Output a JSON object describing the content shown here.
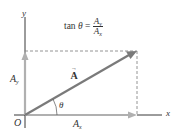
{
  "diagram": {
    "formula": {
      "lhs_func": "tan",
      "lhs_var": "θ",
      "equals": "=",
      "num_main": "A",
      "num_sub": "y",
      "den_main": "A",
      "den_sub": "x"
    },
    "axes": {
      "x_label": "x",
      "y_label": "y",
      "origin_label": "O"
    },
    "components": {
      "ax_main": "A",
      "ax_sub": "x",
      "ay_main": "A",
      "ay_sub": "y"
    },
    "vector": {
      "label": "A",
      "arrow_mark": "→"
    },
    "angle_label": "θ",
    "colors": {
      "vector": "#7a7a7a",
      "component": "#b0b0b0",
      "axis": "#222222",
      "dashed": "#888888",
      "text": "#333333"
    }
  }
}
